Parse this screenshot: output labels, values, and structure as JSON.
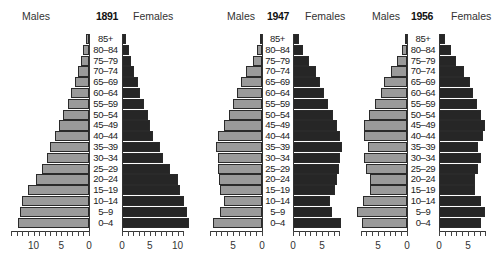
{
  "chart_data": {
    "type": "bar",
    "subtype": "population_pyramid",
    "unit": "% of population",
    "categories": [
      "85+",
      "80–84",
      "75–79",
      "70–74",
      "65–69",
      "60–64",
      "55–59",
      "50–54",
      "45–49",
      "40–44",
      "35–39",
      "30–34",
      "25–29",
      "20–24",
      "15–19",
      "10–14",
      "5–9",
      "0–4"
    ],
    "legend": {
      "left": "Males",
      "right": "Females"
    },
    "colors": {
      "males": "#9a9a9a",
      "females": "#262626"
    },
    "panels": [
      {
        "year": "1891",
        "xticks_males": [
          "10",
          "5",
          "0"
        ],
        "xticks_females": [
          "0",
          "5",
          "10"
        ],
        "xlim": [
          0,
          12
        ],
        "series": [
          {
            "name": "Males",
            "values": [
              0.5,
              1.0,
              1.5,
              2.0,
              2.6,
              3.2,
              3.8,
              4.7,
              5.4,
              6.1,
              7.0,
              7.5,
              8.4,
              9.5,
              11.0,
              12.0,
              12.5,
              12.8
            ]
          },
          {
            "name": "Females",
            "values": [
              0.7,
              1.2,
              1.6,
              2.1,
              2.8,
              3.2,
              4.0,
              4.7,
              5.1,
              5.6,
              6.9,
              7.4,
              8.6,
              10.0,
              10.5,
              11.2,
              11.7,
              12.0
            ]
          }
        ]
      },
      {
        "year": "1947",
        "xticks_males": [
          "5",
          "0"
        ],
        "xticks_females": [
          "0",
          "5"
        ],
        "xlim": [
          0,
          8.5
        ],
        "series": [
          {
            "name": "Males",
            "values": [
              0.4,
              0.8,
              1.6,
              2.8,
              3.6,
              4.3,
              5.0,
              5.7,
              6.6,
              7.6,
              8.0,
              7.6,
              7.6,
              7.4,
              7.2,
              6.5,
              7.3,
              8.4
            ]
          },
          {
            "name": "Females",
            "values": [
              1.0,
              1.8,
              2.7,
              3.9,
              4.6,
              5.4,
              6.1,
              6.9,
              7.5,
              8.1,
              8.5,
              8.1,
              7.9,
              7.5,
              7.2,
              6.3,
              6.8,
              8.3
            ]
          }
        ]
      },
      {
        "year": "1956",
        "xticks_males": [
          "5",
          "0"
        ],
        "xticks_females": [
          "0",
          "5"
        ],
        "xlim": [
          0,
          8.5
        ],
        "series": [
          {
            "name": "Males",
            "values": [
              0.4,
              0.9,
              1.7,
              2.8,
              3.9,
              4.5,
              5.6,
              6.6,
              7.5,
              7.4,
              6.8,
              7.5,
              7.0,
              6.3,
              6.3,
              7.6,
              8.6,
              7.8
            ]
          },
          {
            "name": "Females",
            "values": [
              1.0,
              2.0,
              2.9,
              4.3,
              5.3,
              5.8,
              6.5,
              7.3,
              7.9,
              7.6,
              6.7,
              7.3,
              6.7,
              6.2,
              6.2,
              7.3,
              8.0,
              7.3
            ]
          }
        ]
      }
    ]
  }
}
